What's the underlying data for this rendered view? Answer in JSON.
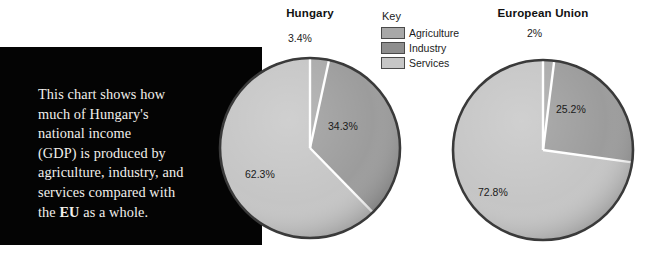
{
  "caption": {
    "line1": "This chart shows how",
    "line2": "much of Hungary's",
    "line3": "national income",
    "line4": "(GDP) is produced by",
    "line5": "agriculture, industry, and",
    "line6": "services compared with",
    "line7_pre": "the ",
    "line7_bold": "EU",
    "line7_post": " as a whole."
  },
  "legend": {
    "title": "Key",
    "items": [
      {
        "label": "Agriculture",
        "color": "#a8a8a8"
      },
      {
        "label": "Industry",
        "color": "#8e8e8e"
      },
      {
        "label": "Services",
        "color": "#c6c6c6"
      }
    ]
  },
  "colors": {
    "agriculture": "#a8a8a8",
    "industry": "#9a9a9a",
    "services": "#c4c4c4",
    "separator": "#ffffff",
    "outline": "#3a3a3a",
    "panel": "#040404",
    "panel_text": "#f2f0ec"
  },
  "chart_data": [
    {
      "type": "pie",
      "title": "Hungary",
      "categories": [
        "Agriculture",
        "Industry",
        "Services"
      ],
      "values": [
        3.4,
        34.3,
        62.3
      ],
      "labels": [
        "3.4%",
        "34.3%",
        "62.3%"
      ],
      "unit": "%",
      "legend_position": "center-top",
      "start_angle_deg": 0,
      "direction": "clockwise"
    },
    {
      "type": "pie",
      "title": "European Union",
      "categories": [
        "Agriculture",
        "Industry",
        "Services"
      ],
      "values": [
        2,
        25.2,
        72.8
      ],
      "labels": [
        "2%",
        "25.2%",
        "72.8%"
      ],
      "unit": "%",
      "legend_position": "center-top",
      "start_angle_deg": 0,
      "direction": "clockwise"
    }
  ]
}
